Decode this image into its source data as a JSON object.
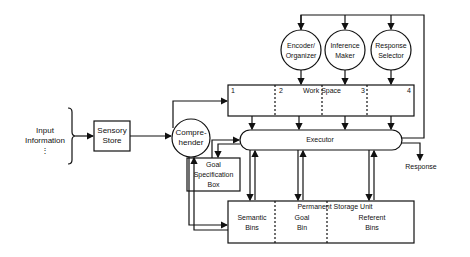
{
  "diagram": {
    "input": {
      "line1": "Input",
      "line2": "Information",
      "ellipsis": "⋮"
    },
    "sensory_store": {
      "line1": "Sensory",
      "line2": "Store"
    },
    "comprehender": {
      "line1": "Compre-",
      "line2": "hender"
    },
    "processors": [
      {
        "line1": "Encoder/",
        "line2": "Organizer"
      },
      {
        "line1": "Inference",
        "line2": "Maker"
      },
      {
        "line1": "Response",
        "line2": "Selector"
      }
    ],
    "work_space": {
      "title": "Work Space",
      "slots": [
        "1",
        "2",
        "3",
        "4"
      ]
    },
    "executor": {
      "label": "Executor"
    },
    "goal_box": {
      "line1": "Goal",
      "line2": "Specification",
      "line3": "Box"
    },
    "response": {
      "label": "Response"
    },
    "permanent_storage": {
      "title": "Permanent Storage Unit",
      "bins": [
        {
          "line1": "Semantic",
          "line2": "Bins"
        },
        {
          "line1": "Goal",
          "line2": "Bin"
        },
        {
          "line1": "Referent",
          "line2": "Bins"
        }
      ]
    }
  }
}
